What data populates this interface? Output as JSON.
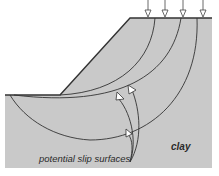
{
  "diagram": {
    "labels": {
      "material": "clay",
      "annotation": "potential slip surfaces"
    },
    "colors": {
      "soil_fill": "#c9c9c9",
      "line": "#333333",
      "arrow_fill": "#ffffff",
      "background": "#ffffff"
    },
    "load_arrows": 4,
    "slip_surfaces": 3
  }
}
